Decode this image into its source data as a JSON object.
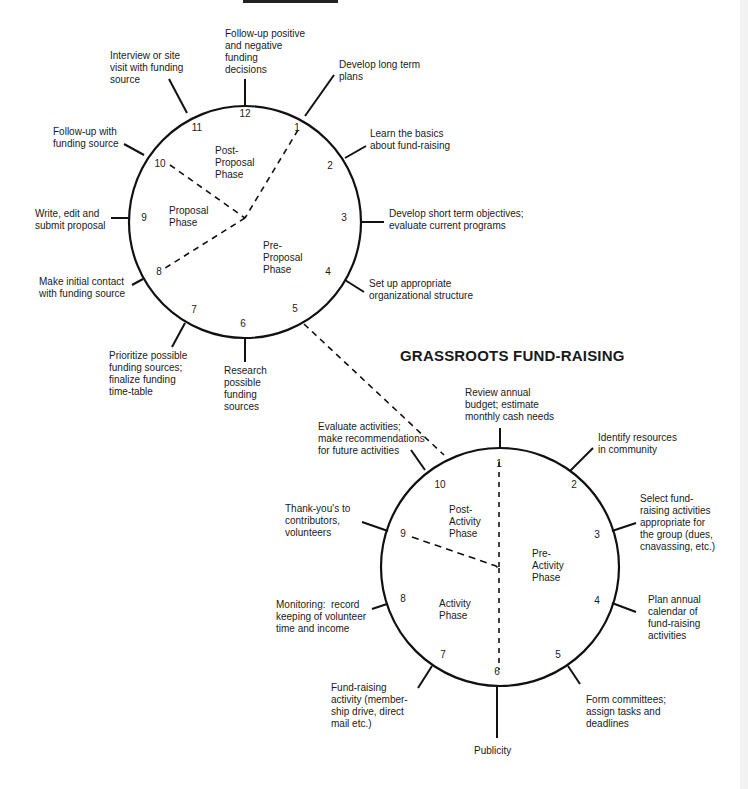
{
  "top_title_fragment": "PROPOSAL WRITING",
  "proposal_clock": {
    "center": [
      245,
      222
    ],
    "radius": 116,
    "numbers": [
      "12",
      "1",
      "2",
      "3",
      "4",
      "5",
      "6",
      "7",
      "8",
      "9",
      "10",
      "11"
    ],
    "phases": {
      "post": "Post-\nProposal\nPhase",
      "proposal": "Proposal\nPhase",
      "pre": "Pre-\nProposal\nPhase"
    },
    "steps": [
      {
        "hour": 12,
        "text": "Follow-up positive\nand negative\nfunding\ndecisions"
      },
      {
        "hour": 1,
        "text": "Develop long term\nplans"
      },
      {
        "hour": 2,
        "text": "Learn the basics\nabout fund-raising"
      },
      {
        "hour": 3,
        "text": "Develop short term objectives;\nevaluate current programs"
      },
      {
        "hour": 4,
        "text": "Set up appropriate\norganizational structure"
      },
      {
        "hour": 6,
        "text": "Research\npossible\nfunding\nsources"
      },
      {
        "hour": 7,
        "text": "Prioritize possible\nfunding sources;\nfinalize funding\ntime-table"
      },
      {
        "hour": 8,
        "text": "Make initial contact\nwith funding source"
      },
      {
        "hour": 9,
        "text": "Write, edit and\nsubmit proposal"
      },
      {
        "hour": 10,
        "text": "Follow-up with\nfunding source"
      },
      {
        "hour": 11,
        "text": "Interview or site\nvisit with funding\nsource"
      }
    ]
  },
  "grassroots_clock": {
    "title": "GRASSROOTS FUND-RAISING",
    "center": [
      500,
      567
    ],
    "radius": 119,
    "numbers": [
      "1",
      "2",
      "3",
      "4",
      "5",
      "6",
      "7",
      "8",
      "9",
      "10"
    ],
    "phases": {
      "post": "Post-\nActivity\nPhase",
      "pre": "Pre-\nActivity\nPhase",
      "activity": "Activity\nPhase"
    },
    "steps": [
      {
        "step": 1,
        "text": "Review annual\nbudget; estimate\nmonthly cash needs"
      },
      {
        "step": 2,
        "text": "Identify resources\nin community"
      },
      {
        "step": 3,
        "text": "Select fund-\nraising activities\nappropriate for\nthe group (dues,\ncnavassing, etc.)"
      },
      {
        "step": 4,
        "text": "Plan annual\ncalendar of\nfund-raising\nactivities"
      },
      {
        "step": 5,
        "text": "Form committees;\nassign tasks and\ndeadlines"
      },
      {
        "step": 6,
        "text": "Publicity"
      },
      {
        "step": 7,
        "text": "Fund-raising\nactivity (member-\nship drive, direct\nmail etc.)"
      },
      {
        "step": 8,
        "text": "Monitoring:  record\nkeeping of volunteer\ntime and income"
      },
      {
        "step": 9,
        "text": "Thank-you's to\ncontributors,\nvolunteers"
      },
      {
        "step": 10,
        "text": "Evaluate activities;\nmake recommendations\nfor future activities"
      }
    ]
  }
}
